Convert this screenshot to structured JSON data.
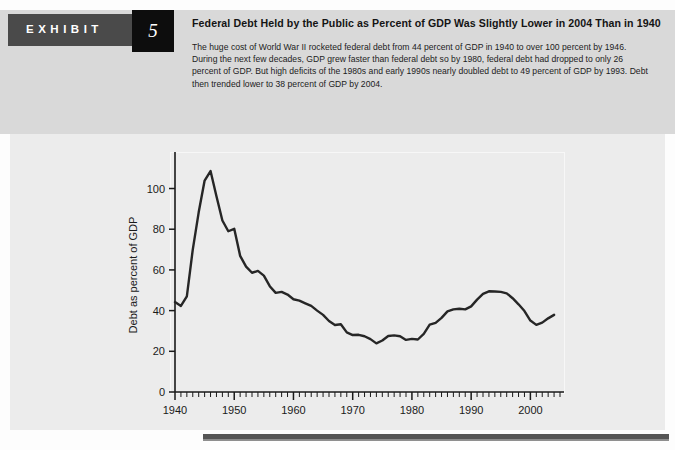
{
  "exhibit": {
    "label": "EXHIBIT",
    "number": "5",
    "title": "Federal Debt Held by the Public as Percent of GDP Was Slightly Lower in 2004 Than in 1940",
    "description": "The huge cost of World War II rocketed federal debt from 44 percent of GDP in 1940 to over 100 percent by 1946. During the next few decades, GDP grew faster than federal debt so by 1980, federal debt had dropped to only 26 percent of GDP. But high deficits of the 1980s and early 1990s nearly doubled debt to 49 percent of GDP by 1993. Debt then trended lower to 38 percent of GDP by 2004."
  },
  "colors": {
    "header_band": "#d9d9d9",
    "exhibit_tab": "#4a4a4a",
    "exhibit_number_box": "#0d0d0d",
    "chart_panel": "#ececec",
    "line": "#262626",
    "axis": "#1a1a1a",
    "bottom_rule": "#555555"
  },
  "chart_data": {
    "type": "line",
    "title": "",
    "xlabel": "",
    "ylabel": "Debt as percent of GDP",
    "xlim": [
      1940,
      2005
    ],
    "ylim": [
      0,
      115
    ],
    "grid": false,
    "legend": "none",
    "ytick_labels": [
      "0",
      "20",
      "40",
      "60",
      "80",
      "100"
    ],
    "ytick_values": [
      0,
      20,
      40,
      60,
      80,
      100
    ],
    "xtick_labels": [
      "1940",
      "1950",
      "1960",
      "1970",
      "1980",
      "1990",
      "2000"
    ],
    "xtick_values": [
      1940,
      1950,
      1960,
      1970,
      1980,
      1990,
      2000
    ],
    "x_minor_tick_interval": 1,
    "series": [
      {
        "name": "Federal debt held by the public as percent of GDP",
        "x": [
          1940,
          1941,
          1942,
          1943,
          1944,
          1945,
          1946,
          1947,
          1948,
          1949,
          1950,
          1951,
          1952,
          1953,
          1954,
          1955,
          1956,
          1957,
          1958,
          1959,
          1960,
          1961,
          1962,
          1963,
          1964,
          1965,
          1966,
          1967,
          1968,
          1969,
          1970,
          1971,
          1972,
          1973,
          1974,
          1975,
          1976,
          1977,
          1978,
          1979,
          1980,
          1981,
          1982,
          1983,
          1984,
          1985,
          1986,
          1987,
          1988,
          1989,
          1990,
          1991,
          1992,
          1993,
          1994,
          1995,
          1996,
          1997,
          1998,
          1999,
          2000,
          2001,
          2002,
          2003,
          2004
        ],
        "values": [
          44.2,
          42.3,
          47.0,
          70.0,
          88.3,
          103.9,
          108.6,
          96.2,
          84.3,
          79.0,
          80.2,
          66.9,
          61.6,
          58.6,
          59.5,
          57.2,
          52.0,
          48.7,
          49.2,
          47.9,
          45.6,
          44.9,
          43.6,
          42.3,
          40.0,
          37.9,
          34.9,
          32.9,
          33.3,
          29.3,
          28.0,
          28.1,
          27.4,
          26.0,
          23.9,
          25.3,
          27.5,
          27.8,
          27.4,
          25.6,
          26.1,
          25.8,
          28.6,
          33.1,
          34.0,
          36.4,
          39.6,
          40.6,
          40.9,
          40.6,
          42.1,
          45.4,
          48.2,
          49.5,
          49.4,
          49.2,
          48.5,
          46.1,
          43.1,
          39.8,
          35.1,
          33.0,
          34.1,
          36.2,
          37.9
        ]
      }
    ]
  }
}
